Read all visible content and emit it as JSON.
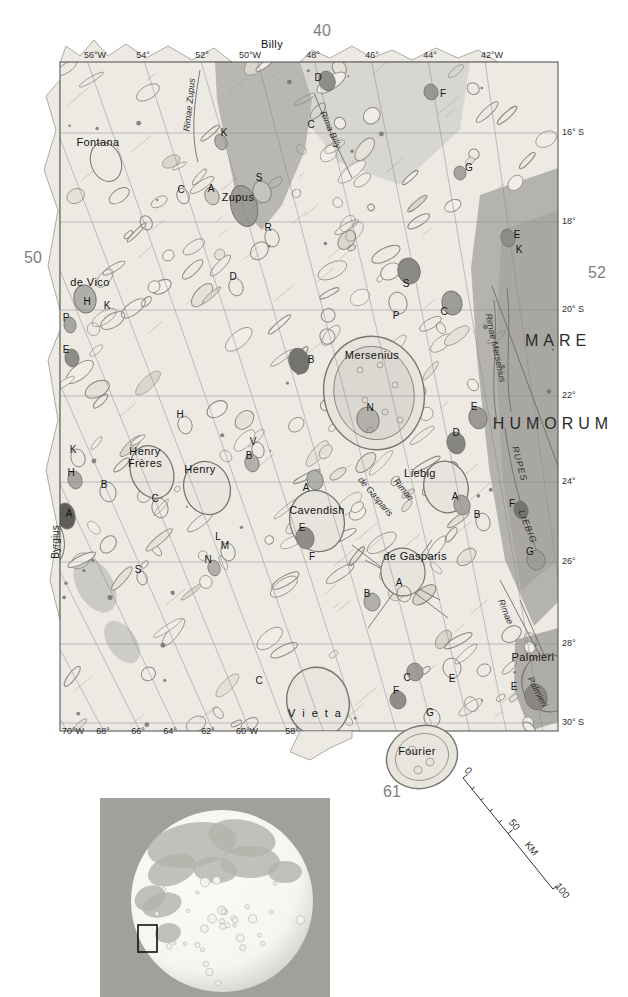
{
  "palette": {
    "paper": "#ffffff",
    "map_base": "#eceae3",
    "map_light": "#f3f1ea",
    "mare": "#b5b3ad",
    "mare_dark": "#a9a7a1",
    "mare_light": "#d2cfc9",
    "outline": "#8d8b84",
    "outline_dark": "#77756d",
    "crater_dark": "#6e6c66",
    "grid": "#8a8a8a",
    "border": "#4a4a4a",
    "inset_bg": "#a2a09b",
    "moon_face": "#f6f5f1",
    "moon_mare": "#b3b1ab"
  },
  "labels": {
    "map_numbers": [
      [
        "40",
        322,
        31
      ],
      [
        "50",
        33,
        258
      ],
      [
        "52",
        597,
        273
      ],
      [
        "61",
        392,
        792
      ]
    ],
    "lon_top": [
      [
        "56°W",
        95,
        56
      ],
      [
        "54°",
        143,
        56
      ],
      [
        "52°",
        202,
        56
      ],
      [
        "50°W",
        250,
        56
      ],
      [
        "48°",
        313,
        56
      ],
      [
        "46°",
        372,
        56
      ],
      [
        "44°",
        430,
        56
      ],
      [
        "42°W",
        492,
        56
      ]
    ],
    "lon_bottom": [
      [
        "70°W",
        73,
        732
      ],
      [
        "68°",
        103,
        732
      ],
      [
        "66°",
        138,
        732
      ],
      [
        "64°",
        170,
        732
      ],
      [
        "62°",
        208,
        732
      ],
      [
        "60°W",
        247,
        732
      ],
      [
        "58°",
        292,
        732
      ]
    ],
    "lat_right": [
      [
        "16° S",
        562,
        133
      ],
      [
        "18°",
        562,
        222
      ],
      [
        "20° S",
        562,
        310
      ],
      [
        "22°",
        562,
        396
      ],
      [
        "24°",
        562,
        482
      ],
      [
        "26°",
        562,
        562
      ],
      [
        "28°",
        562,
        644
      ],
      [
        "30° S",
        562,
        723
      ]
    ],
    "features": [
      [
        "Billy",
        272,
        45
      ],
      [
        "Fontana",
        98,
        143
      ],
      [
        "Zupus",
        238,
        198
      ],
      [
        "de Vico",
        90,
        283
      ],
      [
        "Mersenius",
        372,
        356
      ],
      [
        "Henry\nFrères",
        145,
        458
      ],
      [
        "Henry",
        200,
        470
      ],
      [
        "Liebig",
        420,
        474
      ],
      [
        "Cavendish",
        317,
        511
      ],
      [
        "de Gasparis",
        415,
        557
      ],
      [
        "Palmieri",
        533,
        658
      ],
      [
        "Fourier",
        417,
        752
      ],
      [
        "Vieta",
        318,
        714,
        0,
        "sp"
      ]
    ],
    "mare": [
      [
        "MARE",
        558,
        341
      ],
      [
        "HUMORUM",
        553,
        424
      ]
    ],
    "letters": [
      [
        "D",
        318,
        78
      ],
      [
        "F",
        443,
        94
      ],
      [
        "C",
        311,
        125
      ],
      [
        "K",
        224,
        133
      ],
      [
        "G",
        469,
        168
      ],
      [
        "S",
        259,
        178
      ],
      [
        "C",
        181,
        190
      ],
      [
        "A",
        211,
        189
      ],
      [
        "R",
        268,
        228
      ],
      [
        "E",
        517,
        235
      ],
      [
        "K",
        519,
        250
      ],
      [
        "D",
        233,
        277
      ],
      [
        "S",
        406,
        284
      ],
      [
        "H",
        87,
        302
      ],
      [
        "K",
        107,
        306
      ],
      [
        "C",
        444,
        312
      ],
      [
        "P",
        396,
        316
      ],
      [
        "P",
        66,
        318
      ],
      [
        "E",
        66,
        350
      ],
      [
        "B",
        311,
        360
      ],
      [
        "N",
        370,
        408
      ],
      [
        "E",
        474,
        407
      ],
      [
        "H",
        180,
        415
      ],
      [
        "D",
        456,
        433
      ],
      [
        "V",
        253,
        442
      ],
      [
        "B",
        249,
        456
      ],
      [
        "K",
        73,
        450
      ],
      [
        "H",
        71,
        473
      ],
      [
        "B",
        104,
        485
      ],
      [
        "A",
        306,
        488
      ],
      [
        "C",
        155,
        499
      ],
      [
        "A",
        69,
        514
      ],
      [
        "A",
        455,
        497
      ],
      [
        "B",
        477,
        515
      ],
      [
        "F",
        512,
        504
      ],
      [
        "E",
        302,
        528
      ],
      [
        "L",
        218,
        537
      ],
      [
        "M",
        225,
        546
      ],
      [
        "G",
        530,
        552
      ],
      [
        "F",
        312,
        557
      ],
      [
        "N",
        208,
        560
      ],
      [
        "S",
        138,
        570
      ],
      [
        "A",
        399,
        583
      ],
      [
        "B",
        367,
        594
      ],
      [
        "C",
        259,
        681
      ],
      [
        "C",
        407,
        678
      ],
      [
        "E",
        452,
        679
      ],
      [
        "F",
        396,
        691
      ],
      [
        "E",
        514,
        687
      ],
      [
        "G",
        430,
        713
      ]
    ],
    "rimae": [
      [
        "Rimae Zupus",
        190,
        105,
        -84
      ],
      [
        "Rima Billy",
        330,
        130,
        66
      ],
      [
        "Rimae Mersenius",
        495,
        348,
        78
      ],
      [
        "RUPES",
        519,
        464,
        75,
        "caps"
      ],
      [
        "LIEBIG",
        527,
        527,
        68,
        "caps"
      ],
      [
        "de Gasparis",
        375,
        497,
        50
      ],
      [
        "Rimae",
        403,
        490,
        50
      ],
      [
        "Rimae",
        505,
        612,
        68
      ],
      [
        "Palmieri",
        537,
        692,
        62
      ]
    ],
    "vert_names": [
      [
        "Byrgius",
        56,
        542,
        -90
      ]
    ],
    "scale": [
      [
        "0",
        468,
        771,
        51
      ],
      [
        "50",
        514,
        825,
        51
      ],
      [
        "KM",
        531,
        849,
        51
      ],
      [
        "100",
        562,
        891,
        51
      ]
    ]
  }
}
